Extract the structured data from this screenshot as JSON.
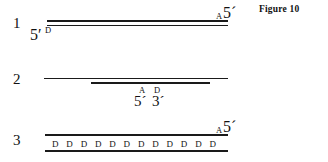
{
  "figure": {
    "caption": "Figure 10",
    "rows": [
      {
        "number": "1",
        "left_end_label": "5ʹ",
        "left_letter": "D",
        "right_letter": "A",
        "right_end_label": "5´"
      },
      {
        "number": "2",
        "letter_a": "A",
        "letter_d": "D",
        "end_label_5": "5´",
        "end_label_3": "3´"
      },
      {
        "number": "3",
        "right_letter": "A",
        "right_end_label": "5´",
        "d_letters": [
          "D",
          "D",
          "D",
          "D",
          "D",
          "D",
          "D",
          "D",
          "D",
          "D",
          "D",
          "D"
        ]
      }
    ]
  },
  "colors": {
    "ink": "#1a1a1a",
    "background": "#ffffff"
  }
}
